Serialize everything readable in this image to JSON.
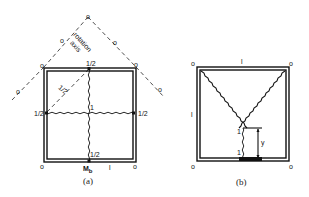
{
  "figure_a": {
    "caption": "(a)",
    "rotation_axis_label_1": "rotation",
    "rotation_axis_label_2": "axis",
    "support_symbol": "o",
    "top_mid_label": "1/2",
    "left_mid_label": "1/2",
    "right_mid_label": "1/2",
    "bottom_mid_label": "1/2",
    "diagonal_label": "1/2",
    "center_label": "1",
    "moment_label": "M",
    "moment_subscript": "b",
    "span_label": "l"
  },
  "figure_b": {
    "caption": "(b)",
    "support_symbol": "o",
    "top_label": "l",
    "left_label": "l",
    "upper_one_label": "1",
    "lower_one_label": "1",
    "dimension_label": "y"
  }
}
